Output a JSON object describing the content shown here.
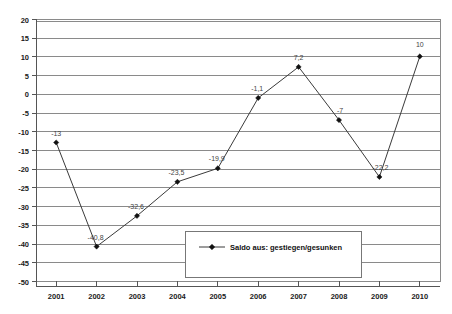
{
  "chart_data": {
    "type": "line",
    "title": "",
    "xlabel": "",
    "ylabel": "",
    "categories": [
      "2001",
      "2002",
      "2003",
      "2004",
      "2005",
      "2006",
      "2007",
      "2008",
      "2009",
      "2010"
    ],
    "values": [
      -13,
      -40.8,
      -32.6,
      -23.5,
      -19.9,
      -1.1,
      7.2,
      -7,
      -22.2,
      10
    ],
    "point_labels": [
      "-13",
      "-40,8",
      "-32,6",
      "-23,5",
      "-19,9",
      "-1,1",
      "7,2",
      "-7",
      "-22,2",
      "10"
    ],
    "ylim": [
      -50,
      20
    ],
    "ytick_step": 5,
    "ytick_labels": [
      "20",
      "15",
      "10",
      "5",
      "0",
      "-5",
      "-10",
      "-15",
      "-20",
      "-25",
      "-30",
      "-35",
      "-40",
      "-45",
      "-50"
    ],
    "ytick_values": [
      20,
      15,
      10,
      5,
      0,
      -5,
      -10,
      -15,
      -20,
      -25,
      -30,
      -35,
      -40,
      -45,
      -50
    ],
    "grid": true,
    "legend_position": "inside-center",
    "series": [
      {
        "name": "Saldo aus: gestiegen/gesunken",
        "values": [
          -13,
          -40.8,
          -32.6,
          -23.5,
          -19.9,
          -1.1,
          7.2,
          -7,
          -22.2,
          10
        ],
        "marker": "diamond",
        "color": "#3a3a3a"
      }
    ]
  },
  "legend": {
    "entries": [
      {
        "label": "Saldo aus: gestiegen/gesunken",
        "marker": "diamond-line-marker"
      }
    ]
  },
  "colors": {
    "gridline": "#8a8a8a",
    "series": "#3a3a3a",
    "marker": "#111111",
    "axis_text": "#1a1a1a",
    "label_text": "#444444",
    "background": "#ffffff"
  }
}
